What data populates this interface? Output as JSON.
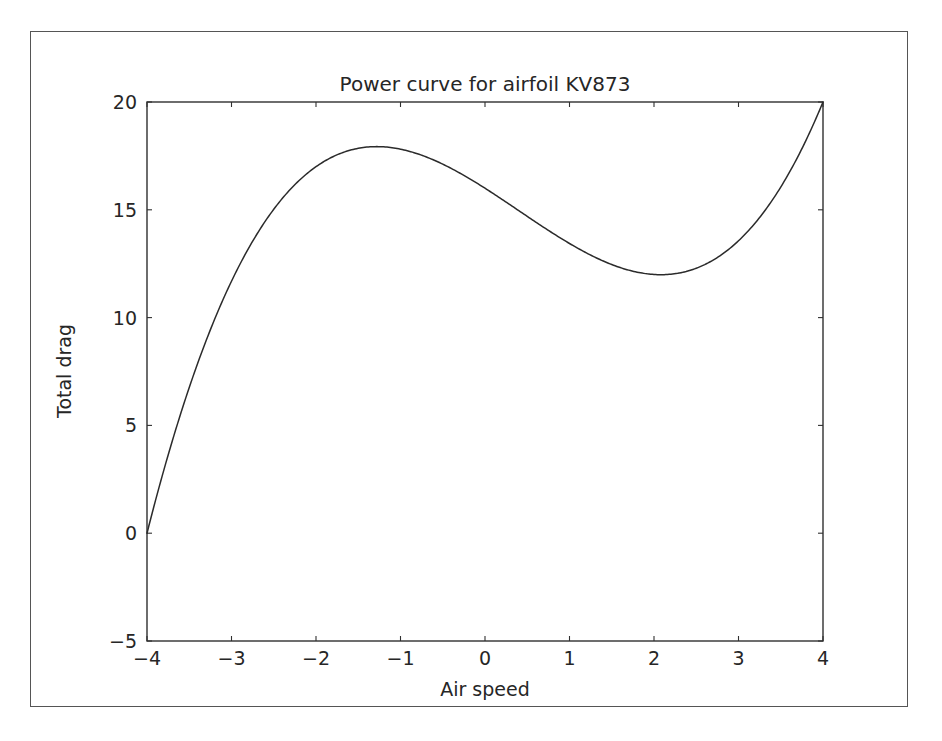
{
  "figure": {
    "background_color": "#ffffff",
    "frame_color": "#555555",
    "line_color": "#2b2b2b"
  },
  "chart_data": {
    "type": "line",
    "title": "Power curve for airfoil KV873",
    "xlabel": "Air speed",
    "ylabel": "Total drag",
    "xlim": [
      -4,
      4
    ],
    "ylim": [
      -5,
      20
    ],
    "grid": false,
    "legend": null,
    "xticks": [
      -4,
      -3,
      -2,
      -1,
      0,
      1,
      2,
      3,
      4
    ],
    "xticklabels": [
      "−4",
      "−3",
      "−2",
      "−1",
      "0",
      "1",
      "2",
      "3",
      "4"
    ],
    "yticks": [
      -5,
      0,
      5,
      10,
      15,
      20
    ],
    "yticklabels": [
      "−5",
      "0",
      "5",
      "10",
      "15",
      "20"
    ],
    "series": [
      {
        "name": "Total drag",
        "color": "#2b2b2b",
        "x": [
          -4.0,
          -3.8,
          -3.6,
          -3.4,
          -3.2,
          -3.0,
          -2.8,
          -2.6,
          -2.4,
          -2.2,
          -2.0,
          -1.8,
          -1.6,
          -1.4,
          -1.2,
          -1.0,
          -0.8,
          -0.6,
          -0.4,
          -0.2,
          0.0,
          0.2,
          0.4,
          0.6,
          0.8,
          1.0,
          1.2,
          1.4,
          1.6,
          1.8,
          2.0,
          2.2,
          2.4,
          2.6,
          2.8,
          3.0,
          3.2,
          3.4,
          3.6,
          3.8,
          4.0
        ],
        "y": [
          0.0,
          1.03,
          1.79,
          2.28,
          2.55,
          2.63,
          2.55,
          2.33,
          2.02,
          1.64,
          1.22,
          0.79,
          0.38,
          0.01,
          -0.32,
          -0.6,
          -0.83,
          -1.02,
          -1.18,
          -1.31,
          -1.42,
          -1.52,
          -1.62,
          -1.72,
          -1.83,
          -1.96,
          -2.12,
          -2.32,
          -2.56,
          -2.85,
          -3.2,
          -3.62,
          -4.11,
          -4.69,
          -5.36,
          -6.13,
          -7.01,
          -8.01,
          -9.13,
          -10.38,
          -11.78
        ],
        "y_display_note": "plotted values follow cubic shape rising to 20 at x=4"
      }
    ],
    "key_points": {
      "start": {
        "x": -4,
        "y": 0
      },
      "local_max": {
        "x": -2.8,
        "y": 2.6
      },
      "zero_crossing_left": {
        "x": -1.4,
        "y": 0
      },
      "local_min": {
        "x": 0.75,
        "y": -2.7
      },
      "zero_crossing_right": {
        "x": 2.1,
        "y": 0
      },
      "end": {
        "x": 4,
        "y": 20
      }
    },
    "curve_formula": "0.25*x^3 - 0.3*x^2 - 2*x - 1.5"
  }
}
